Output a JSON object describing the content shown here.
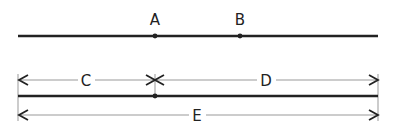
{
  "diagram": {
    "line_color": "#222222",
    "dim_color": "#999999",
    "top_line": {
      "x1": 18,
      "x2": 378,
      "y": 36,
      "points": [
        {
          "label": "A",
          "x": 155
        },
        {
          "label": "B",
          "x": 240
        }
      ]
    },
    "bottom_line": {
      "x1": 18,
      "x2": 378,
      "y": 96,
      "points": [
        {
          "x": 155
        }
      ]
    },
    "dimensions": [
      {
        "label": "C",
        "x1": 18,
        "x2": 155,
        "y": 80,
        "label_x": 86
      },
      {
        "label": "D",
        "x1": 155,
        "x2": 378,
        "y": 80,
        "label_x": 266
      },
      {
        "label": "E",
        "x1": 18,
        "x2": 378,
        "y": 115,
        "label_x": 197
      }
    ]
  }
}
